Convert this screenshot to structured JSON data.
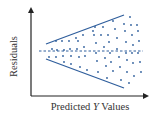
{
  "chart_data": {
    "type": "scatter",
    "title": "",
    "xlabel_prefix": "Predicted ",
    "xlabel_italic": "Y",
    "xlabel_suffix": " Values",
    "xlabel": "Predicted Y Values",
    "ylabel": "Residuals",
    "grid": false,
    "legend": null,
    "reference_line": {
      "style": "dashed",
      "y": 0
    },
    "envelope_lines": [
      {
        "name": "upper",
        "x1": 46,
        "y1": 44,
        "x2": 124,
        "y2": 15
      },
      {
        "name": "lower",
        "x1": 46,
        "y1": 59,
        "x2": 124,
        "y2": 88
      }
    ],
    "points": [
      [
        49,
        57
      ],
      [
        52,
        49
      ],
      [
        56,
        41
      ],
      [
        56,
        57
      ],
      [
        57,
        50
      ],
      [
        62,
        41
      ],
      [
        63,
        56
      ],
      [
        64,
        50
      ],
      [
        64,
        62
      ],
      [
        69,
        41
      ],
      [
        70,
        49
      ],
      [
        71,
        56
      ],
      [
        71,
        64
      ],
      [
        76,
        38
      ],
      [
        77,
        49
      ],
      [
        78,
        41
      ],
      [
        79,
        57
      ],
      [
        80,
        67
      ],
      [
        83,
        35
      ],
      [
        84,
        47
      ],
      [
        85,
        56
      ],
      [
        87,
        70
      ],
      [
        93,
        31
      ],
      [
        94,
        35
      ],
      [
        95,
        27
      ],
      [
        96,
        43
      ],
      [
        96,
        53
      ],
      [
        97,
        61
      ],
      [
        98,
        72
      ],
      [
        101,
        35
      ],
      [
        103,
        27
      ],
      [
        104,
        47
      ],
      [
        105,
        58
      ],
      [
        106,
        66
      ],
      [
        107,
        78
      ],
      [
        108,
        35
      ],
      [
        109,
        42
      ],
      [
        110,
        53
      ],
      [
        111,
        62
      ],
      [
        113,
        71
      ],
      [
        113,
        21
      ],
      [
        115,
        29
      ],
      [
        117,
        38
      ],
      [
        117,
        49
      ],
      [
        119,
        57
      ],
      [
        120,
        67
      ],
      [
        121,
        80
      ],
      [
        124,
        24
      ],
      [
        125,
        31
      ],
      [
        126,
        42
      ],
      [
        126,
        53
      ],
      [
        127,
        60
      ],
      [
        127,
        72
      ],
      [
        129,
        83
      ],
      [
        130,
        17
      ],
      [
        131,
        25
      ],
      [
        132,
        35
      ],
      [
        132,
        53
      ],
      [
        133,
        45
      ],
      [
        133,
        63
      ],
      [
        134,
        76
      ],
      [
        137,
        25
      ],
      [
        138,
        31
      ],
      [
        138,
        53
      ],
      [
        139,
        41
      ],
      [
        140,
        62
      ],
      [
        141,
        72
      ]
    ],
    "colors": {
      "series": "#2f5e9c",
      "axis": "#222222",
      "text": "#333333"
    }
  }
}
